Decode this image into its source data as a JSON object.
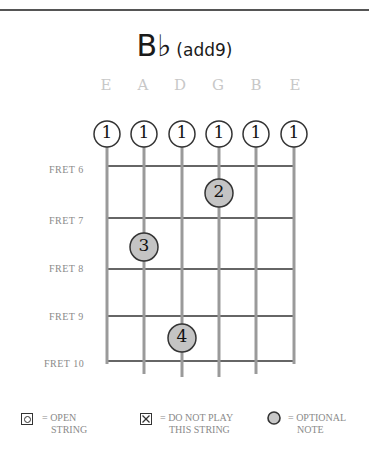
{
  "chord": {
    "root": "B♭",
    "quality": "(add9)"
  },
  "strings": [
    "E",
    "A",
    "D",
    "G",
    "B",
    "E"
  ],
  "barre": {
    "finger_labels": [
      "1",
      "1",
      "1",
      "1",
      "1",
      "1"
    ]
  },
  "frets": [
    {
      "label": "FRET 6"
    },
    {
      "label": "FRET 7"
    },
    {
      "label": "FRET 8"
    },
    {
      "label": "FRET 9"
    },
    {
      "label": "FRET 10"
    }
  ],
  "fingerings": [
    {
      "finger": "2",
      "string": "G",
      "fret_between": "6-7"
    },
    {
      "finger": "3",
      "string": "A",
      "fret_between": "7-8"
    },
    {
      "finger": "4",
      "string": "D",
      "fret_between": "9-10"
    }
  ],
  "legend": {
    "open": {
      "line1": "= OPEN",
      "line2": "STRING"
    },
    "mute": {
      "line1": "= DO NOT PLAY",
      "line2": "THIS STRING"
    },
    "optional": {
      "line1": "= OPTIONAL",
      "line2": "NOTE"
    }
  },
  "colors": {
    "string": "#9a9a9a",
    "fret": "#333333",
    "finger_fill": "#c4c4c4",
    "barre_fill": "#ffffff"
  }
}
